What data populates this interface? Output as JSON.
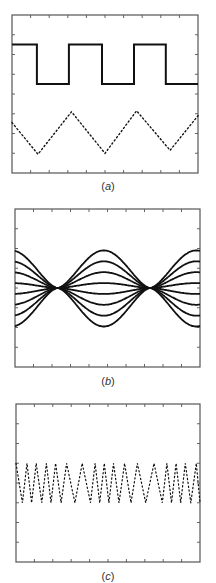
{
  "chart_data": [
    {
      "type": "line",
      "panel_label": "a",
      "caption": "(a)",
      "title": "",
      "xlabel": "",
      "ylabel": "",
      "grid": false,
      "xlim": [
        0,
        10
      ],
      "ylim": [
        0,
        8
      ],
      "x_ticks": 10,
      "y_ticks": 8,
      "series": [
        {
          "name": "square wave",
          "style": "solid",
          "stroke_width": 2,
          "x": [
            0,
            1.34,
            1.34,
            3.06,
            3.06,
            4.84,
            4.84,
            6.56,
            6.56,
            8.27,
            8.27,
            10
          ],
          "y": [
            6.5,
            6.5,
            4.5,
            4.5,
            6.5,
            6.5,
            4.5,
            4.5,
            6.5,
            6.5,
            4.5,
            4.5
          ]
        },
        {
          "name": "triangle wave",
          "style": "dotted",
          "stroke_width": 1.4,
          "x": [
            0,
            1.4,
            3.2,
            5.0,
            6.7,
            8.5,
            10
          ],
          "y": [
            2.55,
            0.95,
            3.1,
            1.0,
            3.15,
            1.15,
            2.9
          ]
        }
      ]
    },
    {
      "type": "line",
      "panel_label": "b",
      "caption": "(b)",
      "title": "",
      "xlabel": "",
      "ylabel": "",
      "grid": false,
      "xlim": [
        0,
        10
      ],
      "ylim": [
        -4,
        4
      ],
      "x_ticks": 10,
      "y_ticks": 8,
      "description": "Family of 8 curves with envelope modulation; curves converge to a node near x=2.3 and x=7.3",
      "node_x": [
        2.3,
        7.3
      ],
      "series": [
        {
          "name": "curve 1",
          "amplitude": 1.9
        },
        {
          "name": "curve 2",
          "amplitude": 1.35
        },
        {
          "name": "curve 3",
          "amplitude": 0.8
        },
        {
          "name": "curve 4",
          "amplitude": 0.25
        },
        {
          "name": "curve 5",
          "amplitude": -0.3
        },
        {
          "name": "curve 6",
          "amplitude": -0.85
        },
        {
          "name": "curve 7",
          "amplitude": -1.4
        },
        {
          "name": "curve 8",
          "amplitude": -1.95
        }
      ],
      "center_y": 0,
      "stroke_width": 1.8
    },
    {
      "type": "line",
      "panel_label": "c",
      "caption": "(c)",
      "title": "",
      "xlabel": "",
      "ylabel": "",
      "grid": false,
      "xlim": [
        0,
        10
      ],
      "ylim": [
        0,
        8
      ],
      "x_ticks": 10,
      "y_ticks": 8,
      "description": "Dotted zigzag oscillating between y=3 and y=5 with varying period; two regions of slower (solid-looking) oscillations",
      "series": [
        {
          "name": "zigzag",
          "style": "dotted",
          "stroke_width": 1.2,
          "x": [
            0,
            0.35,
            0.6,
            0.85,
            1.1,
            1.4,
            1.65,
            1.9,
            2.15,
            2.45,
            2.75,
            3.2,
            3.6,
            4.05,
            4.3,
            4.55,
            4.8,
            5.05,
            5.3,
            5.6,
            5.9,
            6.25,
            6.6,
            7.05,
            7.5,
            7.95,
            8.2,
            8.45,
            8.7,
            8.95,
            9.2,
            9.5,
            9.8,
            10
          ],
          "y": [
            5,
            3,
            5,
            3,
            5,
            3,
            5,
            3,
            5,
            3,
            5,
            3,
            5,
            3,
            5,
            3,
            5,
            3,
            5,
            3,
            5,
            3,
            5,
            3,
            5,
            3,
            5,
            3,
            5,
            3,
            5,
            3,
            5,
            3
          ]
        }
      ]
    }
  ]
}
